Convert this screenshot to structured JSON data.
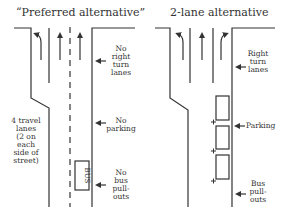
{
  "left_diagram": {
    "title": "“Preferred alternative”",
    "labels": {
      "right_turn": [
        "No",
        "right",
        "turn",
        "lanes"
      ],
      "parking": [
        "No",
        "parking"
      ],
      "bus": [
        "No",
        "bus",
        "pull-",
        "outs"
      ],
      "lanes": [
        "4 travel",
        "lanes",
        "(2 on",
        "each",
        "side of",
        "street)"
      ]
    },
    "bus_box_text": "BUS",
    "arrows": [
      "left-turn",
      "straight",
      "straight"
    ]
  },
  "right_diagram": {
    "title": "2-lane alternative",
    "labels": {
      "right_turn": [
        "Right",
        "turn",
        "lanes"
      ],
      "parking": "Parking",
      "bus": [
        "Bus",
        "pull-",
        "outs"
      ]
    },
    "arrows": [
      "left-turn",
      "straight",
      "right-turn"
    ],
    "parking_spaces": 3
  },
  "colors": {
    "line": "#333333",
    "text": "#333333",
    "background": "#ffffff"
  }
}
